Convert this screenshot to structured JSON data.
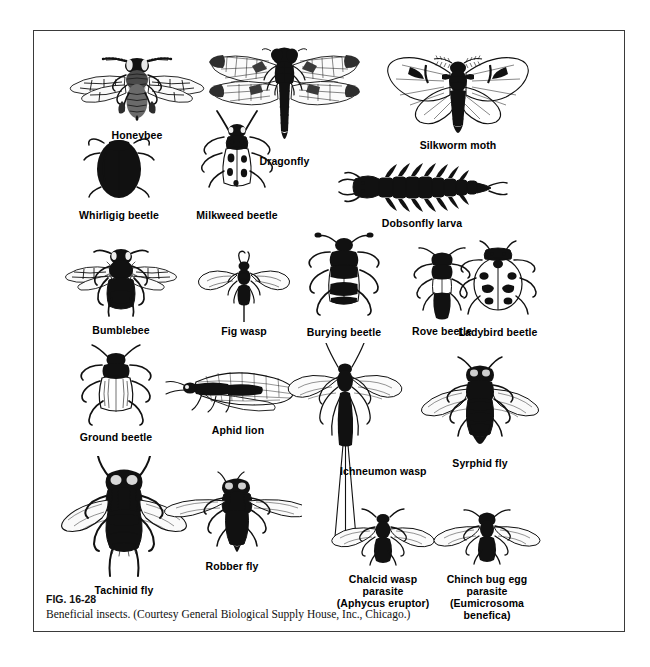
{
  "figure": {
    "number": "FIG. 16-28",
    "credit": "Beneficial insects. (Courtesy General Biological Supply House, Inc., Chicago.)",
    "border_color": "#3a3a3a",
    "ink_color": "#111111",
    "background": "#ffffff"
  },
  "specimens": [
    {
      "id": "honeybee",
      "label": "Honeybee",
      "label_lines": [
        "Honeybee"
      ]
    },
    {
      "id": "dragonfly",
      "label": "Dragonfly",
      "label_lines": [
        "Dragonfly"
      ]
    },
    {
      "id": "silkworm-moth",
      "label": "Silkworm moth",
      "label_lines": [
        "Silkworm moth"
      ]
    },
    {
      "id": "whirligig-beetle",
      "label": "Whirligig beetle",
      "label_lines": [
        "Whirligig beetle"
      ]
    },
    {
      "id": "milkweed-beetle",
      "label": "Milkweed beetle",
      "label_lines": [
        "Milkweed beetle"
      ]
    },
    {
      "id": "dobsonfly-larva",
      "label": "Dobsonfly larva",
      "label_lines": [
        "Dobsonfly larva"
      ]
    },
    {
      "id": "bumblebee",
      "label": "Bumblebee",
      "label_lines": [
        "Bumblebee"
      ]
    },
    {
      "id": "fig-wasp",
      "label": "Fig wasp",
      "label_lines": [
        "Fig wasp"
      ]
    },
    {
      "id": "burying-beetle",
      "label": "Burying beetle",
      "label_lines": [
        "Burying beetle"
      ]
    },
    {
      "id": "rove-beetle",
      "label": "Rove beetle",
      "label_lines": [
        "Rove beetle"
      ]
    },
    {
      "id": "ladybird-beetle",
      "label": "Ladybird beetle",
      "label_lines": [
        "Ladybird beetle"
      ]
    },
    {
      "id": "ground-beetle",
      "label": "Ground beetle",
      "label_lines": [
        "Ground beetle"
      ]
    },
    {
      "id": "aphid-lion",
      "label": "Aphid lion",
      "label_lines": [
        "Aphid lion"
      ]
    },
    {
      "id": "ichneumon-wasp",
      "label": "Ichneumon wasp",
      "label_lines": [
        "Ichneumon wasp"
      ]
    },
    {
      "id": "syrphid-fly",
      "label": "Syrphid fly",
      "label_lines": [
        "Syrphid fly"
      ]
    },
    {
      "id": "tachinid-fly",
      "label": "Tachinid fly",
      "label_lines": [
        "Tachinid fly"
      ]
    },
    {
      "id": "robber-fly",
      "label": "Robber fly",
      "label_lines": [
        "Robber fly"
      ]
    },
    {
      "id": "chalcid-wasp",
      "label": "Chalcid wasp parasite (Aphycus eruptor)",
      "label_lines": [
        "Chalcid wasp",
        "parasite",
        "(Aphycus eruptor)"
      ]
    },
    {
      "id": "chinch-bug-parasite",
      "label": "Chinch bug egg parasite (Eumicrosoma benefica)",
      "label_lines": [
        "Chinch bug egg",
        "parasite",
        "(Eumicrosoma",
        "benefica)"
      ]
    }
  ]
}
